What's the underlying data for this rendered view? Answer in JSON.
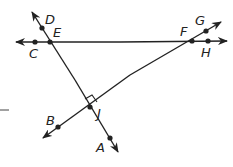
{
  "diagram": {
    "type": "geometry",
    "colors": {
      "line": "#222222",
      "background": "#ffffff"
    },
    "points": {
      "C": {
        "label": "C",
        "x": 35,
        "y": 42,
        "lx": 29,
        "ly": 58
      },
      "E": {
        "label": "E",
        "x": 50,
        "y": 42,
        "lx": 53,
        "ly": 37
      },
      "D": {
        "label": "D",
        "x": 42,
        "y": 28,
        "lx": 45,
        "ly": 24
      },
      "F": {
        "label": "F",
        "x": 192,
        "y": 41,
        "lx": 180,
        "ly": 36
      },
      "G": {
        "label": "G",
        "x": 206,
        "y": 31,
        "lx": 195,
        "ly": 25
      },
      "H": {
        "label": "H",
        "x": 208,
        "y": 41,
        "lx": 201,
        "ly": 57
      },
      "J": {
        "label": "J",
        "x": 90,
        "y": 107,
        "lx": 97,
        "ly": 118
      },
      "B": {
        "label": "B",
        "x": 58,
        "y": 127,
        "lx": 46,
        "ly": 125
      },
      "A": {
        "label": "A",
        "x": 110,
        "y": 138,
        "lx": 96,
        "ly": 152
      }
    },
    "lines": [
      {
        "name": "line-CH",
        "description": "horizontal line through C, E, F, H"
      },
      {
        "name": "line-DA",
        "description": "line through D, E, J, A"
      },
      {
        "name": "line-BG",
        "description": "line through B, J, F, G"
      }
    ],
    "right_angle_at": "J"
  }
}
